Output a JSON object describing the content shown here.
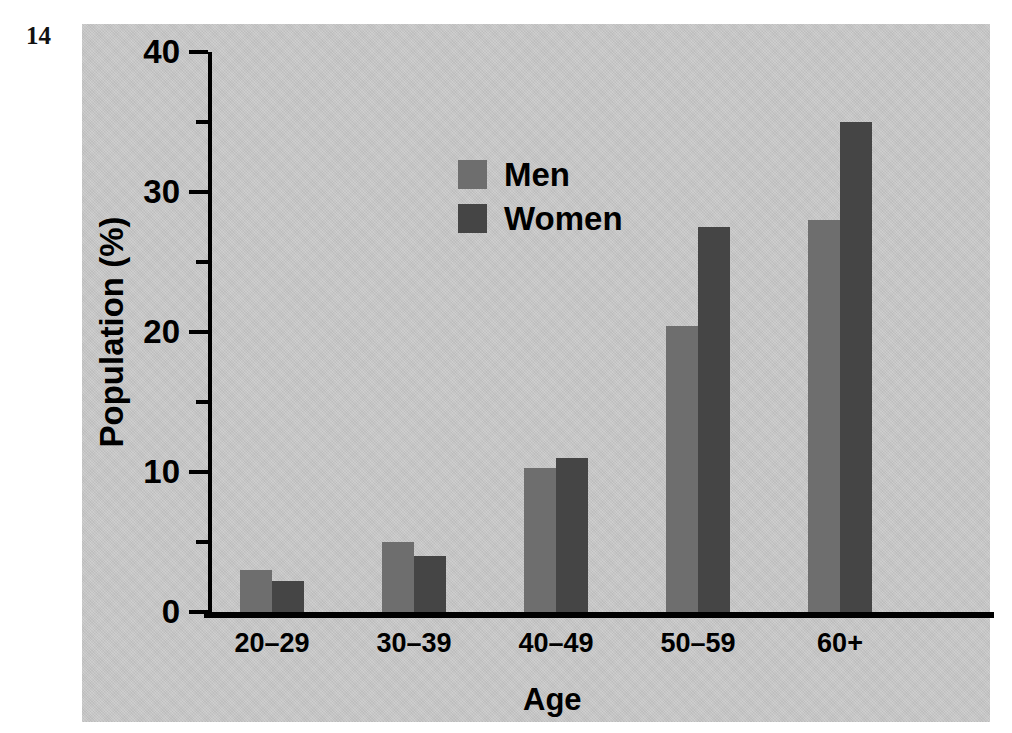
{
  "figure_number": "14",
  "chart_data": {
    "type": "bar",
    "title": "",
    "xlabel": "Age",
    "ylabel": "Population (%)",
    "categories": [
      "20–29",
      "30–39",
      "40–49",
      "50–59",
      "60+"
    ],
    "series": [
      {
        "name": "Men",
        "color": "#6e6e6e",
        "values": [
          3.0,
          5.0,
          10.3,
          20.4,
          28.0
        ]
      },
      {
        "name": "Women",
        "color": "#454545",
        "values": [
          2.2,
          4.0,
          11.0,
          27.5,
          35.0
        ]
      }
    ],
    "ylim": [
      0,
      40
    ],
    "y_major_ticks": [
      0,
      10,
      20,
      30,
      40
    ],
    "y_major_tick_labels": [
      "0",
      "10",
      "20",
      "30",
      "40"
    ],
    "y_minor_ticks": [
      5,
      15,
      25,
      35
    ],
    "grid": false,
    "legend_position": "upper-left-inside",
    "legend_entries": [
      "Men",
      "Women"
    ],
    "background_color": "#c9c9c9",
    "axis_color": "#000000"
  }
}
